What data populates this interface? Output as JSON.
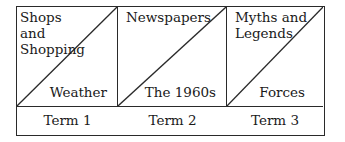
{
  "columns": [
    {
      "top_left": [
        "Shops",
        "and",
        "Shopping"
      ],
      "bottom_right": "Weather",
      "term": "Term 1"
    },
    {
      "top_left": [
        "Newspapers"
      ],
      "bottom_right": "The 1960s",
      "term": "Term 2"
    },
    {
      "top_left": [
        "Myths and",
        "Legends"
      ],
      "bottom_right": "Forces",
      "term": "Term 3"
    }
  ]
}
